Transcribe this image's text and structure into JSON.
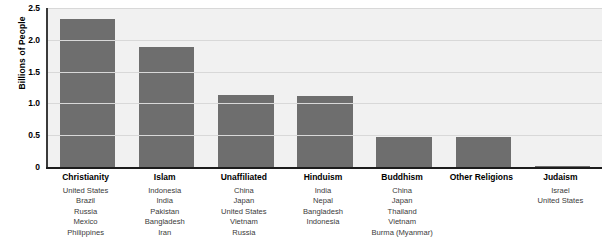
{
  "chart_data": {
    "type": "bar",
    "title": "",
    "xlabel": "",
    "ylabel": "Billions of People",
    "ylim": [
      0,
      2.5
    ],
    "yticks": [
      "0",
      "0.5",
      "1.0",
      "1.5",
      "2.0",
      "2.5"
    ],
    "ytick_values": [
      0,
      0.5,
      1.0,
      1.5,
      2.0,
      2.5
    ],
    "grid": true,
    "legend": "none",
    "bar_color": "#6e6e6e",
    "plot_background": "#f1f1f1",
    "categories": [
      "Christianity",
      "Islam",
      "Unaffiliated",
      "Hinduism",
      "Buddhism",
      "Other Religions",
      "Judaism"
    ],
    "values": [
      2.32,
      1.88,
      1.14,
      1.11,
      0.47,
      0.47,
      0.01
    ],
    "country_lists": [
      [
        "United States",
        "Brazil",
        "Russia",
        "Mexico",
        "Philippines"
      ],
      [
        "Indonesia",
        "India",
        "Pakistan",
        "Bangladesh",
        "Iran"
      ],
      [
        "China",
        "Japan",
        "United States",
        "Vietnam",
        "Russia"
      ],
      [
        "India",
        "Nepal",
        "Bangladesh",
        "Indonesia"
      ],
      [
        "China",
        "Japan",
        "Thailand",
        "Vietnam",
        "Burma (Myanmar)"
      ],
      [],
      [
        "Israel",
        "United States"
      ]
    ]
  }
}
